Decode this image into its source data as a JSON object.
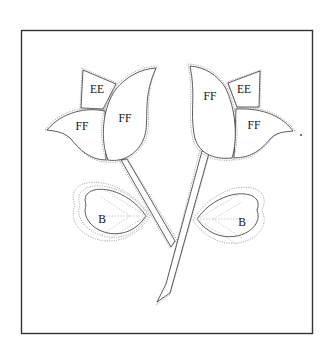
{
  "diagram": {
    "type": "quilt-applique-pattern",
    "labels": {
      "left_tulip": {
        "back_petal": "EE",
        "side_petal": "FF",
        "front_petal": "FF"
      },
      "right_tulip": {
        "back_petal": "EE",
        "side_petal": "FF",
        "front_petal": "FF"
      },
      "left_leaf": "B",
      "right_leaf": "B"
    },
    "colors": {
      "outline": "#333333",
      "seam_allowance": "#999999",
      "background": "#ffffff"
    }
  }
}
